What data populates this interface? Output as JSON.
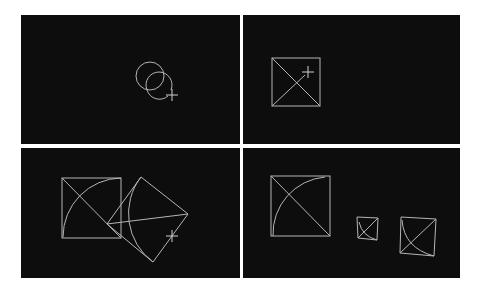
{
  "figure": {
    "layout": "2x2 grid of CAD viewport panels",
    "background_color": "#ffffff",
    "panel_color": "#0d0d0d",
    "line_color": "#b5b5b5",
    "panels": [
      {
        "id": "top-left",
        "description": "Two overlapping circles with crosshair cursor"
      },
      {
        "id": "top-right",
        "description": "Square with a diagonal and partial diagonal, crosshair cursor"
      },
      {
        "id": "bottom-left",
        "description": "Square with arc and diagonal, plus rotated copy with arc, crosshair cursor"
      },
      {
        "id": "bottom-right",
        "description": "Square with arc and diagonal, plus two scaled/skewed copies"
      }
    ]
  }
}
